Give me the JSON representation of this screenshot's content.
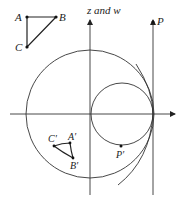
{
  "diagram": {
    "axis_label": "z and w",
    "original_triangle": {
      "vertices": [
        {
          "name": "A",
          "x": 27,
          "y": 17
        },
        {
          "name": "B",
          "x": 56,
          "y": 17
        },
        {
          "name": "C",
          "x": 27,
          "y": 47
        }
      ]
    },
    "image_triangle": {
      "vertices": [
        {
          "name": "C′",
          "x": 54,
          "y": 146
        },
        {
          "name": "A′",
          "x": 70,
          "y": 143
        },
        {
          "name": "B′",
          "x": 73,
          "y": 158
        }
      ]
    },
    "point_P": {
      "name": "P",
      "x": 153,
      "y": 22
    },
    "point_P_image": {
      "name": "P′",
      "x": 121,
      "y": 146
    },
    "large_circle": {
      "cx": 90,
      "cy": 114,
      "r": 64
    },
    "small_circle": {
      "cx": 122,
      "cy": 114,
      "r": 31
    },
    "colors": {
      "line": "#333333",
      "background": "#ffffff"
    }
  },
  "labels": {
    "A": "A",
    "B": "B",
    "C": "C",
    "A_prime": "A′",
    "B_prime": "B′",
    "C_prime": "C′",
    "P": "P",
    "P_prime": "P′",
    "axis": "z and w"
  }
}
